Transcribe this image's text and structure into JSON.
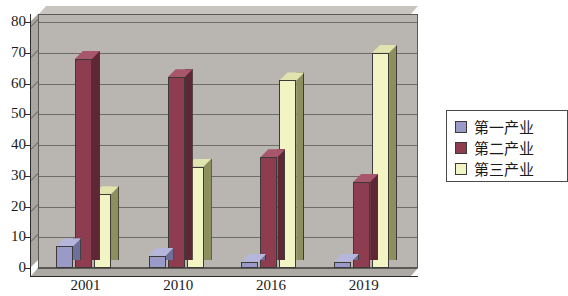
{
  "chart_data": {
    "type": "bar",
    "title": "",
    "subtitle": "",
    "xlabel": "",
    "ylabel": "",
    "categories": [
      "2001",
      "2010",
      "2016",
      "2019"
    ],
    "series": [
      {
        "name": "第一产业",
        "values": [
          7,
          4,
          2,
          2
        ],
        "color": "#9a9ac8"
      },
      {
        "name": "第二产业",
        "values": [
          68,
          62,
          36,
          28
        ],
        "color": "#8e3c50"
      },
      {
        "name": "第三产业",
        "values": [
          24,
          33,
          61,
          70
        ],
        "color": "#f2f4c4"
      }
    ],
    "ylim": [
      0,
      80
    ],
    "yticks": [
      0,
      10,
      20,
      30,
      40,
      50,
      60,
      70,
      80
    ],
    "ytick_labels": [
      "0",
      "10",
      "20",
      "30",
      "40",
      "50",
      "60",
      "70",
      "80"
    ],
    "grid": true,
    "grid_axis": "y",
    "legend_position": "right",
    "style": "3d-column",
    "plot_background": "#b9b6b1"
  },
  "legend": {
    "items": [
      {
        "label": "第一产业",
        "color": "#9a9ac8"
      },
      {
        "label": "第二产业",
        "color": "#8e3c50"
      },
      {
        "label": "第三产业",
        "color": "#f2f4c4"
      }
    ]
  }
}
